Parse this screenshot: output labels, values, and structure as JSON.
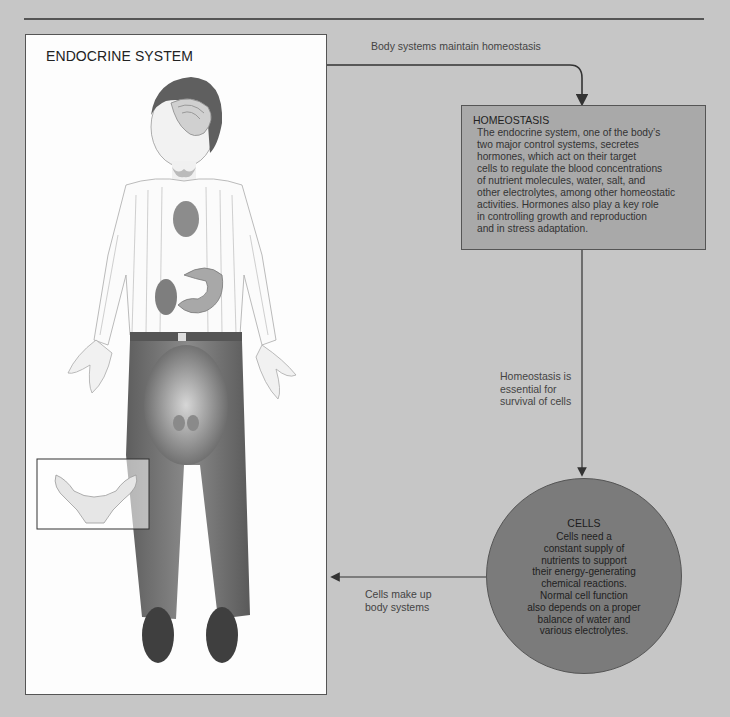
{
  "figure": {
    "title": "ENDOCRINE SYSTEM"
  },
  "arrows": {
    "body_to_homeostasis": "Body systems maintain homeostasis",
    "homeostasis_to_cells": "Homeostasis is\nessential for\nsurvival of cells",
    "cells_to_body": "Cells make up\nbody systems"
  },
  "homeostasis": {
    "title": "HOMEOSTASIS",
    "text": "The endocrine system, one of the body’s\ntwo major control systems, secretes\nhormones, which act on their target\ncells to regulate the blood concentrations\nof nutrient molecules, water, salt, and\nother electrolytes, among other homeostatic\nactivities. Hormones also play a key role\nin controlling growth and reproduction\nand in stress adaptation."
  },
  "cells": {
    "title": "CELLS",
    "text": "Cells need a\nconstant supply of\nnutrients to support\ntheir energy-generating\nchemical reactions.\nNormal cell function\nalso depends on a proper\nbalance of water and\nvarious electrolytes."
  },
  "colors": {
    "background": "#c6c6c6",
    "homeostasis_box": "#a9a9a9",
    "cells_circle": "#7b7b7b",
    "figure_panel": "#fdfdfd",
    "line": "#333333"
  }
}
